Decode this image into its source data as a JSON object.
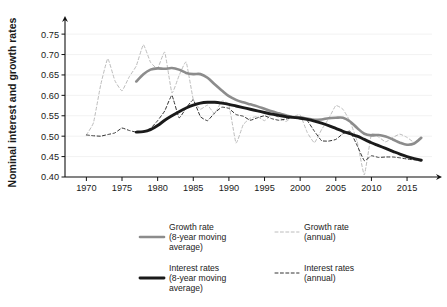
{
  "chart_data": {
    "type": "line",
    "title": "",
    "subtitle": "",
    "xlabel": "",
    "ylabel": "Nominal interest and growth rates",
    "xlim": [
      1967,
      2018.5
    ],
    "ylim": [
      0.4,
      0.765
    ],
    "grid": true,
    "legend_position": "bottom",
    "x_ticks": [
      1970,
      1975,
      1980,
      1985,
      1990,
      1995,
      2000,
      2005,
      2010,
      2015
    ],
    "x_tick_labels": [
      "1970",
      "1975",
      "1980",
      "1985",
      "1990",
      "1995",
      "2000",
      "2005",
      "2010",
      "2015"
    ],
    "y_ticks": [
      0.4,
      0.45,
      0.5,
      0.55,
      0.6,
      0.65,
      0.7,
      0.75
    ],
    "y_tick_labels": [
      "0.40",
      "0.45",
      "0.50",
      "0.55",
      "0.60",
      "0.65",
      "0.70",
      "0.75"
    ],
    "colors": {
      "growth_ma": "#8c8c8c",
      "growth_annual": "#bcbcbc",
      "interest_ma": "#1a1a1a",
      "interest_annual": "#333333",
      "axis": "#111111",
      "grid": "#efefef",
      "background": "#ffffff"
    },
    "series": [
      {
        "name": "Growth rate (8-year moving average)",
        "key": "growth_ma",
        "style": "solid",
        "color": "#8c8c8c",
        "width": 2.6,
        "x": [
          1977,
          1978,
          1979,
          1980,
          1981,
          1982,
          1983,
          1984,
          1985,
          1986,
          1987,
          1988,
          1989,
          1990,
          1991,
          1992,
          1993,
          1994,
          1995,
          1996,
          1997,
          1998,
          1999,
          2000,
          2001,
          2002,
          2003,
          2004,
          2005,
          2006,
          2007,
          2008,
          2009,
          2010,
          2011,
          2012,
          2013,
          2014,
          2015,
          2016,
          2017
        ],
        "y": [
          0.634,
          0.652,
          0.663,
          0.666,
          0.665,
          0.667,
          0.663,
          0.655,
          0.652,
          0.652,
          0.643,
          0.627,
          0.612,
          0.598,
          0.589,
          0.583,
          0.578,
          0.573,
          0.567,
          0.561,
          0.556,
          0.551,
          0.547,
          0.546,
          0.543,
          0.54,
          0.541,
          0.544,
          0.545,
          0.545,
          0.536,
          0.52,
          0.506,
          0.502,
          0.503,
          0.499,
          0.492,
          0.484,
          0.479,
          0.482,
          0.496
        ]
      },
      {
        "name": "Growth rate (annual)",
        "key": "growth_annual",
        "style": "dashed",
        "color": "#bcbcbc",
        "width": 1.0,
        "x": [
          1970,
          1971,
          1972,
          1973,
          1974,
          1975,
          1976,
          1977,
          1978,
          1979,
          1980,
          1981,
          1982,
          1983,
          1984,
          1985,
          1986,
          1987,
          1988,
          1989,
          1990,
          1991,
          1992,
          1993,
          1994,
          1995,
          1996,
          1997,
          1998,
          1999,
          2000,
          2001,
          2002,
          2003,
          2004,
          2005,
          2006,
          2007,
          2008,
          2009,
          2010,
          2011,
          2012,
          2013,
          2014,
          2015,
          2016,
          2017
        ],
        "y": [
          0.503,
          0.533,
          0.625,
          0.69,
          0.636,
          0.611,
          0.645,
          0.672,
          0.724,
          0.681,
          0.666,
          0.706,
          0.606,
          0.648,
          0.682,
          0.59,
          0.566,
          0.576,
          0.555,
          0.586,
          0.577,
          0.483,
          0.528,
          0.544,
          0.548,
          0.538,
          0.553,
          0.546,
          0.536,
          0.548,
          0.552,
          0.509,
          0.484,
          0.516,
          0.543,
          0.575,
          0.566,
          0.536,
          0.487,
          0.405,
          0.505,
          0.498,
          0.486,
          0.497,
          0.505,
          0.497,
          0.485,
          0.499
        ]
      },
      {
        "name": "Interest rates (8-year moving average)",
        "key": "interest_ma",
        "style": "solid",
        "color": "#1a1a1a",
        "width": 2.9,
        "x": [
          1977,
          1978,
          1979,
          1980,
          1981,
          1982,
          1983,
          1984,
          1985,
          1986,
          1987,
          1988,
          1989,
          1990,
          1991,
          1992,
          1993,
          1994,
          1995,
          1996,
          1997,
          1998,
          1999,
          2000,
          2001,
          2002,
          2003,
          2004,
          2005,
          2006,
          2007,
          2008,
          2009,
          2010,
          2011,
          2012,
          2013,
          2014,
          2015,
          2016,
          2017
        ],
        "y": [
          0.51,
          0.511,
          0.516,
          0.526,
          0.539,
          0.55,
          0.56,
          0.569,
          0.576,
          0.581,
          0.583,
          0.583,
          0.581,
          0.578,
          0.574,
          0.57,
          0.566,
          0.562,
          0.558,
          0.554,
          0.551,
          0.548,
          0.546,
          0.544,
          0.541,
          0.537,
          0.532,
          0.526,
          0.519,
          0.512,
          0.506,
          0.5,
          0.492,
          0.484,
          0.477,
          0.47,
          0.463,
          0.456,
          0.45,
          0.445,
          0.441
        ]
      },
      {
        "name": "Interest rates (annual)",
        "key": "interest_annual",
        "style": "dashed",
        "color": "#333333",
        "width": 1.0,
        "x": [
          1970,
          1971,
          1972,
          1973,
          1974,
          1975,
          1976,
          1977,
          1978,
          1979,
          1980,
          1981,
          1982,
          1983,
          1984,
          1985,
          1986,
          1987,
          1988,
          1989,
          1990,
          1991,
          1992,
          1993,
          1994,
          1995,
          1996,
          1997,
          1998,
          1999,
          2000,
          2001,
          2002,
          2003,
          2004,
          2005,
          2006,
          2007,
          2008,
          2009,
          2010,
          2011,
          2012,
          2013,
          2014,
          2015,
          2016,
          2017
        ],
        "y": [
          0.503,
          0.501,
          0.5,
          0.504,
          0.508,
          0.52,
          0.514,
          0.51,
          0.512,
          0.519,
          0.538,
          0.562,
          0.6,
          0.545,
          0.569,
          0.589,
          0.548,
          0.538,
          0.557,
          0.571,
          0.568,
          0.553,
          0.549,
          0.539,
          0.545,
          0.55,
          0.543,
          0.539,
          0.542,
          0.546,
          0.548,
          0.538,
          0.512,
          0.489,
          0.488,
          0.492,
          0.506,
          0.512,
          0.477,
          0.44,
          0.452,
          0.448,
          0.449,
          0.449,
          0.447,
          0.444,
          0.442,
          0.441
        ]
      }
    ],
    "legend": [
      {
        "id": "growth-ma",
        "style": "solid",
        "color": "#8c8c8c",
        "width": 2.6,
        "lines": [
          "Growth rate",
          "(8-year moving",
          "average)"
        ]
      },
      {
        "id": "growth-annual",
        "style": "dashed",
        "color": "#bcbcbc",
        "width": 1.0,
        "lines": [
          "Growth rate",
          "(annual)"
        ]
      },
      {
        "id": "interest-ma",
        "style": "solid",
        "color": "#1a1a1a",
        "width": 2.9,
        "lines": [
          "Interest rates",
          "(8-year moving",
          "average)"
        ]
      },
      {
        "id": "interest-annual",
        "style": "dashed",
        "color": "#333333",
        "width": 1.0,
        "lines": [
          "Interest rates",
          "(annual)"
        ]
      }
    ]
  }
}
